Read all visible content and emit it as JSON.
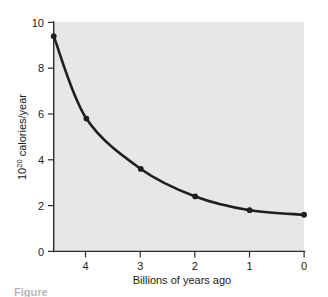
{
  "figure": {
    "caption_partial": "Figure",
    "background_color": "#ffffff",
    "plot_area_color": "#e7e7e7",
    "curve_color": "#1f1f1f",
    "axis_color": "#2b2b2b"
  },
  "chart_data": {
    "type": "line",
    "title": "",
    "subtitle": "",
    "xlabel": "Billions of years ago",
    "ylabel": "10^20 calories/year",
    "ylabel_base": "10",
    "ylabel_exponent": "20",
    "ylabel_rest": " calories/year",
    "x_tick_labels": [
      "4",
      "3",
      "2",
      "1",
      "0"
    ],
    "x_tick_values": [
      4,
      3,
      2,
      1,
      0
    ],
    "y_tick_labels": [
      "0",
      "2",
      "4",
      "6",
      "8",
      "10"
    ],
    "y_tick_values": [
      0,
      2,
      4,
      6,
      8,
      10
    ],
    "xlim": [
      4.6,
      0
    ],
    "ylim": [
      0,
      10
    ],
    "x_axis_reversed": true,
    "grid": false,
    "legend": false,
    "legend_position": "none",
    "series": [
      {
        "name": "Solar energy received",
        "marker": "circle",
        "x": [
          4.6,
          4.0,
          3.0,
          2.0,
          1.0,
          0.0
        ],
        "y": [
          9.4,
          5.8,
          3.6,
          2.4,
          1.8,
          1.6
        ]
      }
    ]
  }
}
